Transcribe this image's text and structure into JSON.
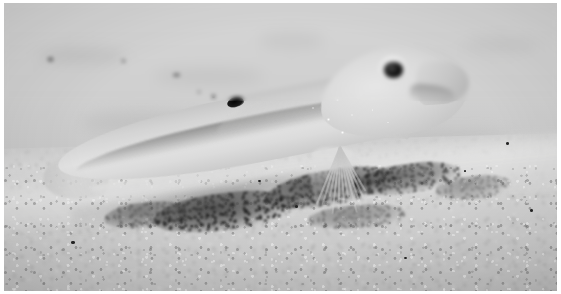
{
  "image": {
    "domain": "Natural-Image",
    "subject": "pale goby fish resting on a sandy seabed",
    "caption": "",
    "width": 561,
    "height": 294,
    "border": {
      "color": "#ffffff",
      "width_px": 4
    },
    "palette": {
      "sand_light": "#d8d8d6",
      "sand_mid": "#c9c9c7",
      "sand_dark": "#bdbdbb",
      "background_blur": "#d2d2d0",
      "fish_body_light": "#e2e2e0",
      "fish_body_mid": "#d4d4d2",
      "fish_body_shadow": "#c5c5c3",
      "fin_translucent": "#dedede",
      "eye_pupil": "#000000",
      "eye_iris": "#e4e4e2",
      "dorsal_spot": "#0a0a0a",
      "rubble_dark": "#282826"
    },
    "scene": {
      "orientation": "fish facing right, body tilted nose-up",
      "focus": "shallow depth of field; background sand blurred, fish and near sand sharp",
      "lighting": "even diffuse light from above-front"
    },
    "elements": {
      "fish_label": "goby",
      "eye_label": "eye",
      "dorsal_spot_label": "dark dorsal spot",
      "pelvic_fin_label": "pelvic fin",
      "pectoral_fin_label": "pectoral fin",
      "caudal_fin_label": "caudal fin",
      "anal_fin_label": "anal fin",
      "dorsal_fin_label": "dorsal fin",
      "snout_label": "snout and mouth",
      "rubble_label": "dark coarse sediment mound",
      "sand_label": "sandy seabed",
      "background_label": "blurred distant sand"
    },
    "specks": [
      {
        "x": 60.1,
        "y": 33.2,
        "size": 2.4
      },
      {
        "x": 62.8,
        "y": 38.5,
        "size": 2.0
      },
      {
        "x": 64.2,
        "y": 31.4,
        "size": 1.8
      },
      {
        "x": 58.4,
        "y": 40.1,
        "size": 2.6
      },
      {
        "x": 66.5,
        "y": 36.8,
        "size": 1.7
      },
      {
        "x": 61.0,
        "y": 44.6,
        "size": 2.2
      },
      {
        "x": 69.3,
        "y": 41.2,
        "size": 1.6
      },
      {
        "x": 55.7,
        "y": 36.0,
        "size": 1.9
      }
    ],
    "flecks": [
      {
        "x": 37.6,
        "y": 32.1,
        "w": 1.3,
        "h": 1.1
      },
      {
        "x": 35.1,
        "y": 30.4,
        "w": 1.0,
        "h": 0.9
      },
      {
        "x": 21.4,
        "y": 19.8,
        "w": 1.1,
        "h": 1.0
      },
      {
        "x": 7.9,
        "y": 19.2,
        "w": 2.6,
        "h": 1.2
      },
      {
        "x": 30.5,
        "y": 24.6,
        "w": 3.2,
        "h": 1.0
      },
      {
        "x": 90.8,
        "y": 48.4,
        "w": 1.4,
        "h": 1.2
      },
      {
        "x": 83.1,
        "y": 57.9,
        "w": 1.2,
        "h": 1.0
      },
      {
        "x": 52.6,
        "y": 70.3,
        "w": 1.3,
        "h": 1.1
      },
      {
        "x": 12.2,
        "y": 82.7,
        "w": 1.5,
        "h": 1.2
      },
      {
        "x": 72.4,
        "y": 88.1,
        "w": 1.2,
        "h": 1.0
      },
      {
        "x": 46.0,
        "y": 61.5,
        "w": 1.1,
        "h": 0.9
      },
      {
        "x": 95.2,
        "y": 71.6,
        "w": 1.3,
        "h": 1.1
      }
    ],
    "blotches": [
      {
        "x": 6,
        "y": 16,
        "w": 16,
        "h": 5,
        "opacity": 0.5
      },
      {
        "x": 27,
        "y": 23,
        "w": 20,
        "h": 5,
        "opacity": 0.42
      },
      {
        "x": 46,
        "y": 10,
        "w": 12,
        "h": 6,
        "opacity": 0.35
      },
      {
        "x": 62,
        "y": 28,
        "w": 18,
        "h": 6,
        "opacity": 0.3
      },
      {
        "x": 83,
        "y": 12,
        "w": 14,
        "h": 5,
        "opacity": 0.33
      },
      {
        "x": 14,
        "y": 38,
        "w": 22,
        "h": 7,
        "opacity": 0.4
      },
      {
        "x": 72,
        "y": 44,
        "w": 20,
        "h": 7,
        "opacity": 0.36
      },
      {
        "x": 40,
        "y": 46,
        "w": 15,
        "h": 6,
        "opacity": 0.3
      }
    ],
    "rubble_patches": [
      {
        "x": 27,
        "y": 66,
        "w": 26,
        "h": 13,
        "rot": -7,
        "opacity": 0.95
      },
      {
        "x": 47,
        "y": 58,
        "w": 24,
        "h": 12,
        "rot": -10,
        "opacity": 0.9
      },
      {
        "x": 63,
        "y": 56,
        "w": 20,
        "h": 10,
        "rot": -8,
        "opacity": 0.72
      },
      {
        "x": 18,
        "y": 69,
        "w": 16,
        "h": 9,
        "rot": -5,
        "opacity": 0.6
      },
      {
        "x": 78,
        "y": 60,
        "w": 14,
        "h": 8,
        "rot": -6,
        "opacity": 0.42
      },
      {
        "x": 55,
        "y": 70,
        "w": 18,
        "h": 8,
        "rot": -4,
        "opacity": 0.45
      }
    ]
  }
}
